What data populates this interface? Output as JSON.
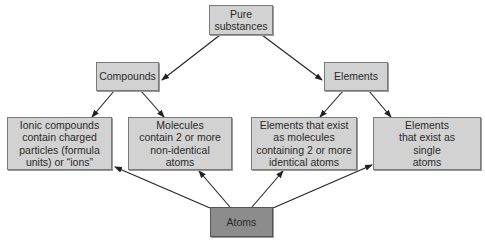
{
  "diagram": {
    "nodes": {
      "pure_substances": "Pure substances",
      "compounds": "Compounds",
      "elements": "Elements",
      "ionic_compounds": "Ionic compounds contain charged particles (formula units) or “ions”",
      "molecules_nonidentical": "Molecules contain 2 or more non-identical atoms",
      "elements_molecules": "Elements that exist as molecules containing 2 or more identical atoms",
      "elements_single": "Elements that exist as single atoms",
      "atoms": "Atoms"
    },
    "edges": [
      {
        "from": "pure_substances",
        "to": "compounds"
      },
      {
        "from": "pure_substances",
        "to": "elements"
      },
      {
        "from": "compounds",
        "to": "ionic_compounds"
      },
      {
        "from": "compounds",
        "to": "molecules_nonidentical"
      },
      {
        "from": "elements",
        "to": "elements_molecules"
      },
      {
        "from": "elements",
        "to": "elements_single"
      },
      {
        "from": "atoms",
        "to": "ionic_compounds"
      },
      {
        "from": "atoms",
        "to": "molecules_nonidentical"
      },
      {
        "from": "atoms",
        "to": "elements_molecules"
      },
      {
        "from": "atoms",
        "to": "elements_single"
      }
    ],
    "colors": {
      "box": "#d2d2d2",
      "atoms_box": "#8c8c8c",
      "border": "#7a7a7a"
    }
  }
}
